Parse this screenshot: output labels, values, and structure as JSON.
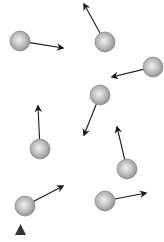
{
  "diagram": {
    "colors": {
      "background": "#ffffff",
      "ball_light": "#f2f2f2",
      "ball_mid": "#bdbdbd",
      "ball_dark": "#8a8a8a",
      "ball_stroke": "#777777",
      "arrow": "#1a1a1a",
      "marker": "#333333"
    },
    "ball_radius": 10,
    "particles": [
      {
        "id": "p1",
        "cx": 20,
        "cy": 41,
        "x2": 63,
        "y2": 48
      },
      {
        "id": "p2",
        "cx": 105,
        "cy": 42,
        "x2": 84,
        "y2": 4
      },
      {
        "id": "p3",
        "cx": 153,
        "cy": 67,
        "x2": 112,
        "y2": 77
      },
      {
        "id": "p4",
        "cx": 100,
        "cy": 95,
        "x2": 84,
        "y2": 135
      },
      {
        "id": "p5",
        "cx": 40,
        "cy": 149,
        "x2": 38,
        "y2": 106
      },
      {
        "id": "p6",
        "cx": 127,
        "cy": 169,
        "x2": 117,
        "y2": 127
      },
      {
        "id": "p7",
        "cx": 25,
        "cy": 206,
        "x2": 63,
        "y2": 186
      },
      {
        "id": "p8",
        "cx": 105,
        "cy": 201,
        "x2": 146,
        "y2": 193
      }
    ],
    "marker": {
      "shape": "triangle",
      "points": "15,235 26,235 20.5,224"
    }
  }
}
